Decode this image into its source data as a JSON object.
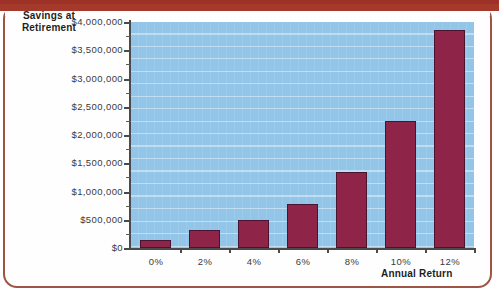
{
  "figure": {
    "frame_color": "#9e5344",
    "band_color": "#a5392b",
    "plot_bg": "#92c5e8",
    "bar_color": "#8e2549",
    "bar_border": "#4a1430"
  },
  "chart_data": {
    "type": "bar",
    "title": "",
    "xlabel": "Annual Return",
    "ylabel": "Savings at Retirement",
    "ylabel_lines": [
      "Savings at",
      "Retirement"
    ],
    "categories": [
      "0%",
      "2%",
      "4%",
      "6%",
      "8%",
      "10%",
      "12%"
    ],
    "values": [
      150000,
      320000,
      500000,
      775000,
      1350000,
      2250000,
      3850000
    ],
    "ylim": [
      0,
      4000000
    ],
    "ytick_values": [
      0,
      500000,
      1000000,
      1500000,
      2000000,
      2500000,
      3000000,
      3500000,
      4000000
    ],
    "ytick_labels": [
      "$0",
      "$500,000",
      "$1,000,000",
      "$1,500,000",
      "$2,000,000",
      "$2,500,000",
      "$3,000,000",
      "$3,500,000",
      "$4,000,000"
    ],
    "minor_ticks": true,
    "grid": "horizontal",
    "legend": null,
    "series": [
      {
        "name": "Savings at Retirement",
        "values": [
          150000,
          320000,
          500000,
          775000,
          1350000,
          2250000,
          3850000
        ]
      }
    ]
  }
}
